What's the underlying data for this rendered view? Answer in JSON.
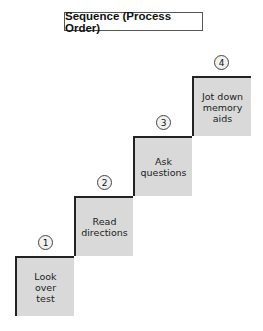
{
  "title": "Sequence (Process Order)",
  "steps": [
    {
      "number": "1",
      "label": "Look\nover\ntest"
    },
    {
      "number": "2",
      "label": "Read\ndirections"
    },
    {
      "number": "3",
      "label": "Ask\nquestions"
    },
    {
      "number": "4",
      "label": "Jot down\nmemory\naids"
    }
  ],
  "colors": {
    "step_fill": "#d9d9d9",
    "outline": "#222222"
  }
}
